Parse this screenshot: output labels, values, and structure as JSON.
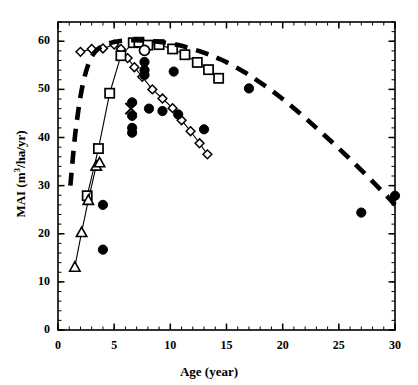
{
  "chart_data": {
    "type": "scatter",
    "title": "",
    "xlabel": "Age (year)",
    "ylabel": "MAI (m3/ha/yr)",
    "ylabel_display": "MAI (m³/ha/yr)",
    "xlim": [
      0,
      30
    ],
    "ylim": [
      0,
      64
    ],
    "xticks": [
      0,
      5,
      10,
      15,
      20,
      25,
      30
    ],
    "yticks": [
      0,
      10,
      20,
      30,
      40,
      50,
      60
    ],
    "xtick_labels": [
      "0",
      "5",
      "10",
      "15",
      "20",
      "25",
      "30"
    ],
    "ytick_labels": [
      "0",
      "10",
      "20",
      "30",
      "40",
      "50",
      "60"
    ],
    "x_minor_step": 1,
    "y_minor_step": 2,
    "grid": false,
    "legend": "none",
    "series": [
      {
        "name": "open-diamond-series",
        "marker": "open-diamond",
        "line": "thin-solid",
        "color": "#000000",
        "points": [
          [
            2.0,
            57.8
          ],
          [
            3.0,
            58.4
          ],
          [
            4.0,
            58.5
          ],
          [
            5.0,
            59.3
          ],
          [
            5.6,
            58.4
          ],
          [
            6.2,
            56.5
          ],
          [
            6.8,
            54.6
          ],
          [
            7.5,
            52.6
          ],
          [
            8.4,
            50.0
          ],
          [
            9.3,
            48.1
          ],
          [
            10.2,
            46.1
          ],
          [
            11.0,
            43.6
          ],
          [
            11.8,
            41.3
          ],
          [
            12.6,
            38.8
          ],
          [
            13.3,
            36.5
          ]
        ]
      },
      {
        "name": "open-square-series",
        "marker": "open-square",
        "line": "thin-solid",
        "color": "#000000",
        "points": [
          [
            2.6,
            27.9
          ],
          [
            3.6,
            37.7
          ],
          [
            4.6,
            49.2
          ],
          [
            5.6,
            57.0
          ],
          [
            6.7,
            59.7
          ],
          [
            7.2,
            59.8
          ],
          [
            8.0,
            59.2
          ],
          [
            9.0,
            59.3
          ],
          [
            10.2,
            58.4
          ],
          [
            11.3,
            57.2
          ],
          [
            12.4,
            55.6
          ],
          [
            13.4,
            54.1
          ],
          [
            14.3,
            52.3
          ]
        ]
      },
      {
        "name": "open-triangle-series",
        "marker": "open-triangle",
        "line": "thin-solid",
        "color": "#000000",
        "points": [
          [
            1.5,
            13.1
          ],
          [
            2.1,
            20.3
          ],
          [
            2.7,
            27.0
          ],
          [
            3.4,
            34.1
          ],
          [
            3.7,
            34.8
          ]
        ]
      },
      {
        "name": "open-circle-point",
        "marker": "open-circle",
        "line": "none",
        "color": "#000000",
        "points": [
          [
            7.7,
            58.1
          ]
        ]
      },
      {
        "name": "cross-point",
        "marker": "x-cross",
        "line": "none",
        "color": "#000000",
        "points": [
          [
            6.5,
            46.0
          ]
        ]
      },
      {
        "name": "filled-circle-series",
        "marker": "filled-circle",
        "line": "none",
        "color": "#000000",
        "points": [
          [
            4.0,
            26.0
          ],
          [
            4.0,
            16.7
          ],
          [
            6.6,
            47.3
          ],
          [
            6.6,
            44.5
          ],
          [
            6.6,
            42.0
          ],
          [
            6.6,
            41.0
          ],
          [
            7.7,
            55.7
          ],
          [
            7.7,
            54.0
          ],
          [
            7.7,
            53.0
          ],
          [
            8.1,
            46.0
          ],
          [
            9.3,
            45.5
          ],
          [
            10.3,
            53.7
          ],
          [
            10.7,
            44.8
          ],
          [
            13.0,
            41.7
          ],
          [
            17.0,
            50.2
          ],
          [
            27.0,
            24.4
          ],
          [
            30.0,
            27.9
          ]
        ]
      },
      {
        "name": "thick-dashed-envelope",
        "marker": "none",
        "line": "thick-dashed",
        "color": "#000000",
        "points": [
          [
            1.1,
            30.0
          ],
          [
            1.6,
            42.0
          ],
          [
            2.3,
            52.0
          ],
          [
            3.2,
            57.5
          ],
          [
            4.6,
            59.6
          ],
          [
            6.5,
            60.2
          ],
          [
            8.5,
            60.0
          ],
          [
            10.5,
            59.3
          ],
          [
            12.5,
            58.0
          ],
          [
            14.5,
            56.2
          ],
          [
            17.0,
            53.0
          ],
          [
            20.0,
            48.0
          ],
          [
            23.0,
            42.0
          ],
          [
            26.0,
            35.5
          ],
          [
            29.0,
            28.5
          ],
          [
            30.0,
            26.0
          ]
        ]
      }
    ]
  },
  "axes": {
    "x_axis_name": "Age (year)",
    "y_axis_name": "MAI (m3/ha/yr)"
  }
}
